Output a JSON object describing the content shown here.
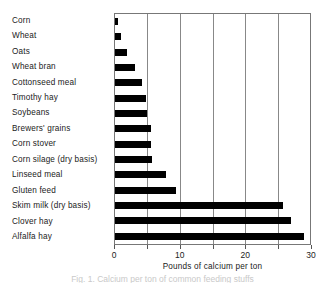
{
  "chart_data": {
    "type": "bar",
    "orientation": "horizontal",
    "title": "",
    "xlabel": "Pounds of calcium per ton",
    "ylabel": "",
    "xlim": [
      0,
      30
    ],
    "xticks": [
      0,
      10,
      20,
      30
    ],
    "xticklabels": [
      "0",
      "10",
      "20",
      "30"
    ],
    "minor_gridlines": [
      5,
      10,
      15,
      20,
      25
    ],
    "grid": true,
    "legend": null,
    "bar_color": "#000000",
    "categories": [
      "Corn",
      "Wheat",
      "Oats",
      "Wheat bran",
      "Cottonseed meal",
      "Timothy hay",
      "Soybeans",
      "Brewers' grains",
      "Corn stover",
      "Corn silage (dry basis)",
      "Linseed meal",
      "Gluten feed",
      "Skim milk (dry basis)",
      "Clover hay",
      "Alfalfa hay"
    ],
    "values": [
      0.4,
      0.9,
      1.8,
      3.0,
      4.1,
      4.7,
      5.0,
      5.6,
      5.6,
      5.7,
      7.8,
      9.4,
      25.8,
      27.0,
      29.0
    ]
  },
  "caption": {
    "text": "Fig. 1.  Calcium per ton of common feeding stuffs"
  }
}
